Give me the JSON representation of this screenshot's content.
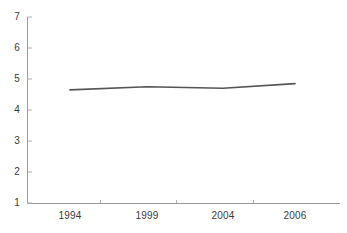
{
  "chart_data": {
    "type": "line",
    "title": "",
    "subtitle": "",
    "xlabel": "",
    "ylabel": "",
    "x": [
      "1994",
      "1999",
      "2004",
      "2006"
    ],
    "categories": [
      "1994",
      "1999",
      "2004",
      "2006"
    ],
    "values": [
      4.65,
      4.75,
      4.7,
      4.85
    ],
    "series": [
      {
        "name": "",
        "values": [
          4.65,
          4.75,
          4.7,
          4.85
        ]
      }
    ],
    "ylim": [
      1,
      7
    ],
    "yticks": [
      1,
      2,
      3,
      4,
      5,
      6,
      7
    ],
    "ytick_labels": [
      "1",
      "2",
      "3",
      "4",
      "5",
      "6",
      "7"
    ],
    "xtick_labels": [
      "1994",
      "1999",
      "2004",
      "2006"
    ],
    "grid": false,
    "legend": false,
    "legend_position": "none",
    "markers": false,
    "line_color": "#555555",
    "axis_color": "#9a9a9a",
    "text_color": "#3a3a3a",
    "background_color": "#ffffff"
  },
  "axes": {
    "y_ticks": [
      {
        "label": "7",
        "value": 7
      },
      {
        "label": "6",
        "value": 6
      },
      {
        "label": "5",
        "value": 5
      },
      {
        "label": "4",
        "value": 4
      },
      {
        "label": "3",
        "value": 3
      },
      {
        "label": "2",
        "value": 2
      },
      {
        "label": "1",
        "value": 1
      }
    ],
    "x_ticks": [
      {
        "label": "1994",
        "value": 1994
      },
      {
        "label": "1999",
        "value": 1999
      },
      {
        "label": "2004",
        "value": 2004
      },
      {
        "label": "2006",
        "value": 2006
      }
    ]
  }
}
